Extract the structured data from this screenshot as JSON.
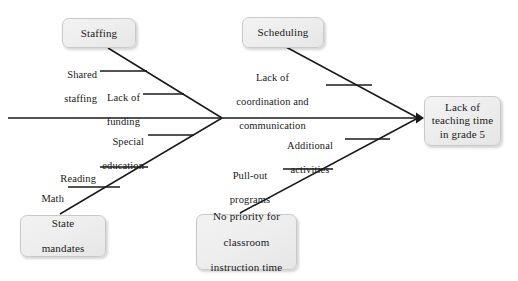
{
  "diagram": {
    "type": "fishbone-ishikawa",
    "title": "",
    "effect": {
      "label": "Lack of teaching time in grade 5",
      "lines": [
        "Lack of",
        "teaching time",
        "in grade 5"
      ]
    },
    "categories": [
      {
        "id": "staffing",
        "label": "Staffing",
        "position": "upper-left",
        "causes": [
          {
            "label": "Shared staffing",
            "lines": [
              "Shared",
              "staffing"
            ]
          },
          {
            "label": "Lack of funding",
            "lines": [
              "Lack of",
              "funding"
            ]
          }
        ]
      },
      {
        "id": "scheduling",
        "label": "Scheduling",
        "position": "upper-right",
        "causes": [
          {
            "label": "Lack of coordination and communication",
            "lines": [
              "Lack of",
              "coordination and",
              "communication"
            ]
          }
        ]
      },
      {
        "id": "state-mandates",
        "label": "State mandates",
        "lines": [
          "State",
          "mandates"
        ],
        "position": "lower-left",
        "causes": [
          {
            "label": "Special education",
            "lines": [
              "Special",
              "education"
            ]
          },
          {
            "label": "Reading",
            "lines": [
              "Reading"
            ]
          },
          {
            "label": "Math",
            "lines": [
              "Math"
            ]
          }
        ]
      },
      {
        "id": "no-priority",
        "label": "No priority for classroom instruction time",
        "lines": [
          "No priority for",
          "classroom",
          "instruction time"
        ],
        "position": "lower-right",
        "causes": [
          {
            "label": "Additional activities",
            "lines": [
              "Additional",
              "activities"
            ]
          },
          {
            "label": "Pull-out programs",
            "lines": [
              "Pull-out",
              "programs"
            ]
          }
        ]
      }
    ],
    "colors": {
      "background": "#ffffff",
      "box_fill": "#eeeeee",
      "box_border": "#c9c9c9",
      "line": "#1a1a1a",
      "text": "#1a1a1a"
    }
  }
}
